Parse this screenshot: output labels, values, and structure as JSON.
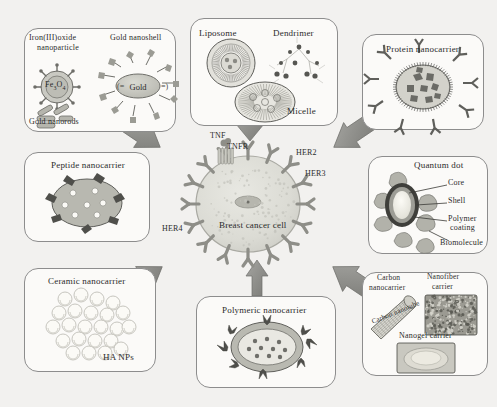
{
  "figure": {
    "background_color": "#f2f1ef",
    "panel_border_color": "#8d8d8d",
    "arrow_color": "#8a8a8a",
    "cell_color": "#dcdcd6",
    "receptor_color": "#9a9a96"
  },
  "center": {
    "cell_label": "Breast cancer cell",
    "receptors": [
      {
        "name": "TNF",
        "label": "TNF"
      },
      {
        "name": "TNFR",
        "label": "TNFR"
      },
      {
        "name": "HER2",
        "label": "HER2"
      },
      {
        "name": "HER3",
        "label": "HER3"
      },
      {
        "name": "HER4",
        "label": "HER4"
      }
    ]
  },
  "panels": {
    "metallic": {
      "name": "metallic-nanocarrier-panel",
      "items": [
        {
          "label": "Iron(III)oxide"
        },
        {
          "label": "nanoparticle"
        },
        {
          "label": "Fe"
        },
        {
          "label": "3"
        },
        {
          "label": "O"
        },
        {
          "label": "4"
        },
        {
          "label": "Gold nanoshell"
        },
        {
          "label": "Gold"
        },
        {
          "label": "Gold nanorods"
        }
      ],
      "iron_oxide_title_line1": "Iron(III)oxide",
      "iron_oxide_title_line2": "nanoparticle",
      "core_formula_main": "Fe",
      "core_formula_sub1": "3",
      "core_formula_mid": "O",
      "core_formula_sub2": "4",
      "gold_nanoshell_title": "Gold nanoshell",
      "gold_core_label": "Gold",
      "gold_nanorods_label": "Gold nanorods"
    },
    "lipid": {
      "name": "lipid-nanocarrier-panel",
      "liposome_label": "Liposome",
      "dendrimer_label": "Dendrimer",
      "micelle_label": "Micelle"
    },
    "protein": {
      "name": "protein-nanocarrier-panel",
      "title": "Protein nanocarrier"
    },
    "peptide": {
      "name": "peptide-nanocarrier-panel",
      "title": "Peptide nanocarrier"
    },
    "ceramic": {
      "name": "ceramic-nanocarrier-panel",
      "title": "Ceramic nanocarrier",
      "ha_label": "HA NPs"
    },
    "polymeric": {
      "name": "polymeric-nanocarrier-panel",
      "title": "Polymeric nanocarrier"
    },
    "quantumdot": {
      "name": "quantum-dot-panel",
      "title": "Quantum dot",
      "callouts": [
        {
          "label": "Core"
        },
        {
          "label": "Shell"
        },
        {
          "label": "Polymer"
        },
        {
          "label": "coating"
        },
        {
          "label": "Biomolecule"
        }
      ],
      "core_label": "Core",
      "shell_label": "Shell",
      "polymer_label": "Polymer",
      "coating_label": "coating",
      "biomolecule_label": "Biomolecule"
    },
    "carbon": {
      "name": "carbon-nanocarrier-panel",
      "carbon_line1": "Carbon",
      "carbon_line2": "nanocarrier",
      "nanofiber_line1": "Nanofiber",
      "nanofiber_line2": "carrier",
      "nanotube_label": "Carbon nanotube",
      "nanogel_label": "Nanogel carrier"
    }
  }
}
